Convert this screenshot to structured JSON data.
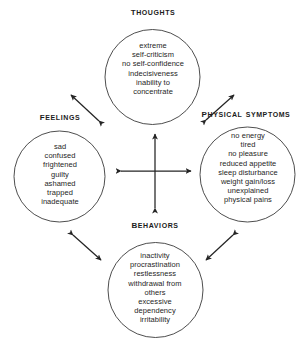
{
  "diagram": {
    "type": "cycle-diagram",
    "ink_color": "#242424",
    "background_color": "#ffffff",
    "nodes": [
      {
        "id": "thoughts",
        "heading": "Thoughts",
        "items": [
          "extreme",
          "self-criticism",
          "no self-confidence",
          "indecisiveness",
          "inability to",
          "concentrate"
        ]
      },
      {
        "id": "feelings",
        "heading": "Feelings",
        "items": [
          "sad",
          "confused",
          "frightened",
          "guilty",
          "ashamed",
          "trapped",
          "inadequate"
        ]
      },
      {
        "id": "physical",
        "heading": "Physical symptoms",
        "items": [
          "no energy",
          "tired",
          "no pleasure",
          "reduced appetite",
          "sleep disturbance",
          "weight gain/loss",
          "unexplained",
          "physical pains"
        ]
      },
      {
        "id": "behaviors",
        "heading": "Behaviors",
        "items": [
          "inactivity",
          "procrastination",
          "restlessness",
          "withdrawal from",
          "others",
          "excessive",
          "dependency",
          "irritability"
        ]
      }
    ],
    "connectors": [
      {
        "id": "feelings-thoughts",
        "from": "feelings",
        "to": "thoughts",
        "style": "double-headed-arrow"
      },
      {
        "id": "thoughts-physical",
        "from": "thoughts",
        "to": "physical",
        "style": "double-headed-arrow"
      },
      {
        "id": "feelings-behaviors",
        "from": "feelings",
        "to": "behaviors",
        "style": "double-headed-arrow"
      },
      {
        "id": "behaviors-physical",
        "from": "behaviors",
        "to": "physical",
        "style": "double-headed-arrow"
      },
      {
        "id": "center-cross",
        "from": "center",
        "to": "all",
        "style": "four-way-double-arrow"
      }
    ]
  }
}
